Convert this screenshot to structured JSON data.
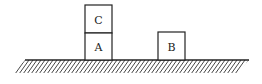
{
  "diagram": {
    "type": "physics-blocks-on-surface",
    "blocks": [
      {
        "id": "C",
        "label": "C",
        "x": 85,
        "y": 5,
        "w": 27,
        "h": 28
      },
      {
        "id": "A",
        "label": "A",
        "x": 85,
        "y": 33,
        "w": 27,
        "h": 27
      },
      {
        "id": "B",
        "label": "B",
        "x": 158,
        "y": 32,
        "w": 27,
        "h": 28
      }
    ],
    "ground": {
      "x1": 25,
      "x2": 249,
      "y": 60,
      "hatch_depth": 12
    },
    "colors": {
      "stroke": "#222222",
      "background": "#ffffff"
    }
  }
}
